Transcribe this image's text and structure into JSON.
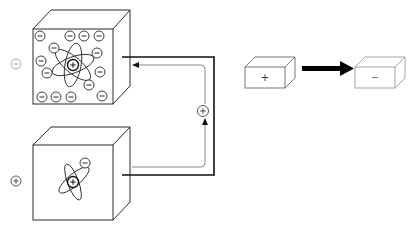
{
  "diagram": {
    "colors": {
      "line": "#2a2a2a",
      "light_line": "#8a8a8a",
      "faint_line": "#9a9a9a",
      "arrow": "#000000",
      "background": "#ffffff"
    },
    "top_cube": {
      "label": "negatively charged body",
      "outside_ion": {
        "symbol": "−",
        "x": 16,
        "y": 64
      },
      "nucleus": {
        "symbol": "+",
        "x": 73,
        "y": 65
      },
      "electrons": [
        {
          "x": 40,
          "y": 36
        },
        {
          "x": 70,
          "y": 36
        },
        {
          "x": 84,
          "y": 36
        },
        {
          "x": 99,
          "y": 36
        },
        {
          "x": 54,
          "y": 48
        },
        {
          "x": 97,
          "y": 53
        },
        {
          "x": 41,
          "y": 61
        },
        {
          "x": 100,
          "y": 72
        },
        {
          "x": 47,
          "y": 73
        },
        {
          "x": 89,
          "y": 85
        },
        {
          "x": 42,
          "y": 97
        },
        {
          "x": 56,
          "y": 97
        },
        {
          "x": 71,
          "y": 97
        },
        {
          "x": 102,
          "y": 96
        }
      ],
      "electron_symbol": "−"
    },
    "bottom_cube": {
      "label": "positively charged body",
      "outside_ion": {
        "symbol": "+",
        "x": 16,
        "y": 181
      },
      "nucleus": {
        "symbol": "+",
        "x": 73,
        "y": 182
      },
      "electrons": [
        {
          "x": 85,
          "y": 163
        }
      ],
      "electron_symbol": "−"
    },
    "circuit": {
      "carrier_symbol": "+",
      "carrier_x": 203,
      "carrier_y": 111
    },
    "schematic": {
      "left_box_symbol": "+",
      "right_box_symbol": "−",
      "arrow": "right"
    }
  }
}
